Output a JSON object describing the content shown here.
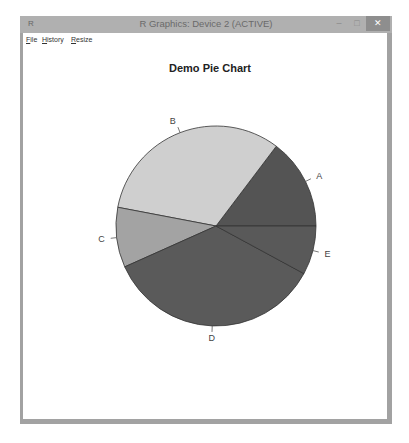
{
  "window": {
    "title": "R Graphics: Device 2 (ACTIVE)",
    "app_icon": "R",
    "controls": {
      "minimize": "–",
      "maximize": "□",
      "close": "✕"
    }
  },
  "menubar": {
    "items": [
      {
        "label": "File",
        "accel": "F",
        "rest": "ile"
      },
      {
        "label": "History",
        "accel": "H",
        "rest": "istory"
      },
      {
        "label": "Resize",
        "accel": "R",
        "rest": "esize"
      }
    ]
  },
  "chart_data": {
    "type": "pie",
    "title": "Demo Pie Chart",
    "categories": [
      "A",
      "B",
      "C",
      "D",
      "E"
    ],
    "values": [
      14.7,
      32.3,
      9.7,
      35.4,
      7.9
    ],
    "colors": [
      "#545454",
      "#cfcfcf",
      "#a3a3a3",
      "#5a5a5a",
      "#595959"
    ],
    "start_angle_deg": 0,
    "direction": "counterclockwise",
    "legend": "none"
  }
}
